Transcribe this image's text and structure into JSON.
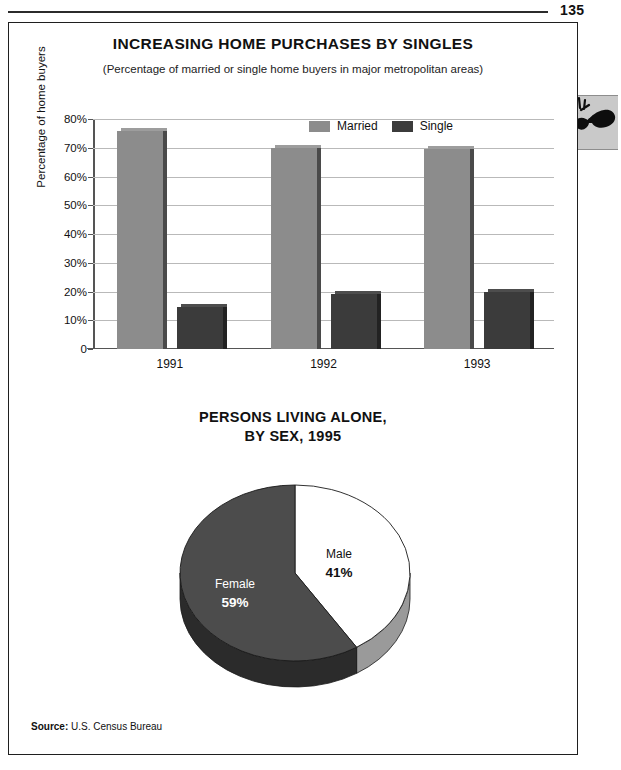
{
  "page": {
    "folio": "135",
    "margin_icon": "sunglasses-icon"
  },
  "source": {
    "label": "Source:",
    "value": "U.S. Census Bureau"
  },
  "chart_data": [
    {
      "type": "bar",
      "title": "INCREASING HOME PURCHASES BY SINGLES",
      "subtitle": "(Percentage of married or single home buyers in major metropolitan areas)",
      "xlabel": "",
      "ylabel": "Percentage of home buyers",
      "categories": [
        "1991",
        "1992",
        "1993"
      ],
      "series": [
        {
          "name": "Married",
          "values": [
            76,
            70,
            69.5
          ],
          "color": "#8c8c8c"
        },
        {
          "name": "Single",
          "values": [
            14.5,
            19,
            20
          ],
          "color": "#3b3b3b"
        }
      ],
      "ylim": [
        0,
        80
      ],
      "yticks": [
        "80%",
        "70%",
        "60%",
        "50%",
        "40%",
        "30%",
        "20%",
        "10%",
        "0"
      ],
      "ytick_values": [
        80,
        70,
        60,
        50,
        40,
        30,
        20,
        10,
        0
      ],
      "grid": true,
      "legend_position": "top-right"
    },
    {
      "type": "pie",
      "title_line1": "PERSONS LIVING ALONE,",
      "title_line2": "BY SEX, 1995",
      "slices": [
        {
          "name": "Male",
          "value": 41,
          "label": "Male",
          "pct_label": "41%",
          "color": "#ffffff",
          "side_color": "#9a9a9a"
        },
        {
          "name": "Female",
          "value": 59,
          "label": "Female",
          "pct_label": "59%",
          "color": "#4c4c4c",
          "side_color": "#2b2b2b"
        }
      ],
      "start_angle_deg": 0,
      "direction": "clockwise",
      "three_d": true
    }
  ]
}
